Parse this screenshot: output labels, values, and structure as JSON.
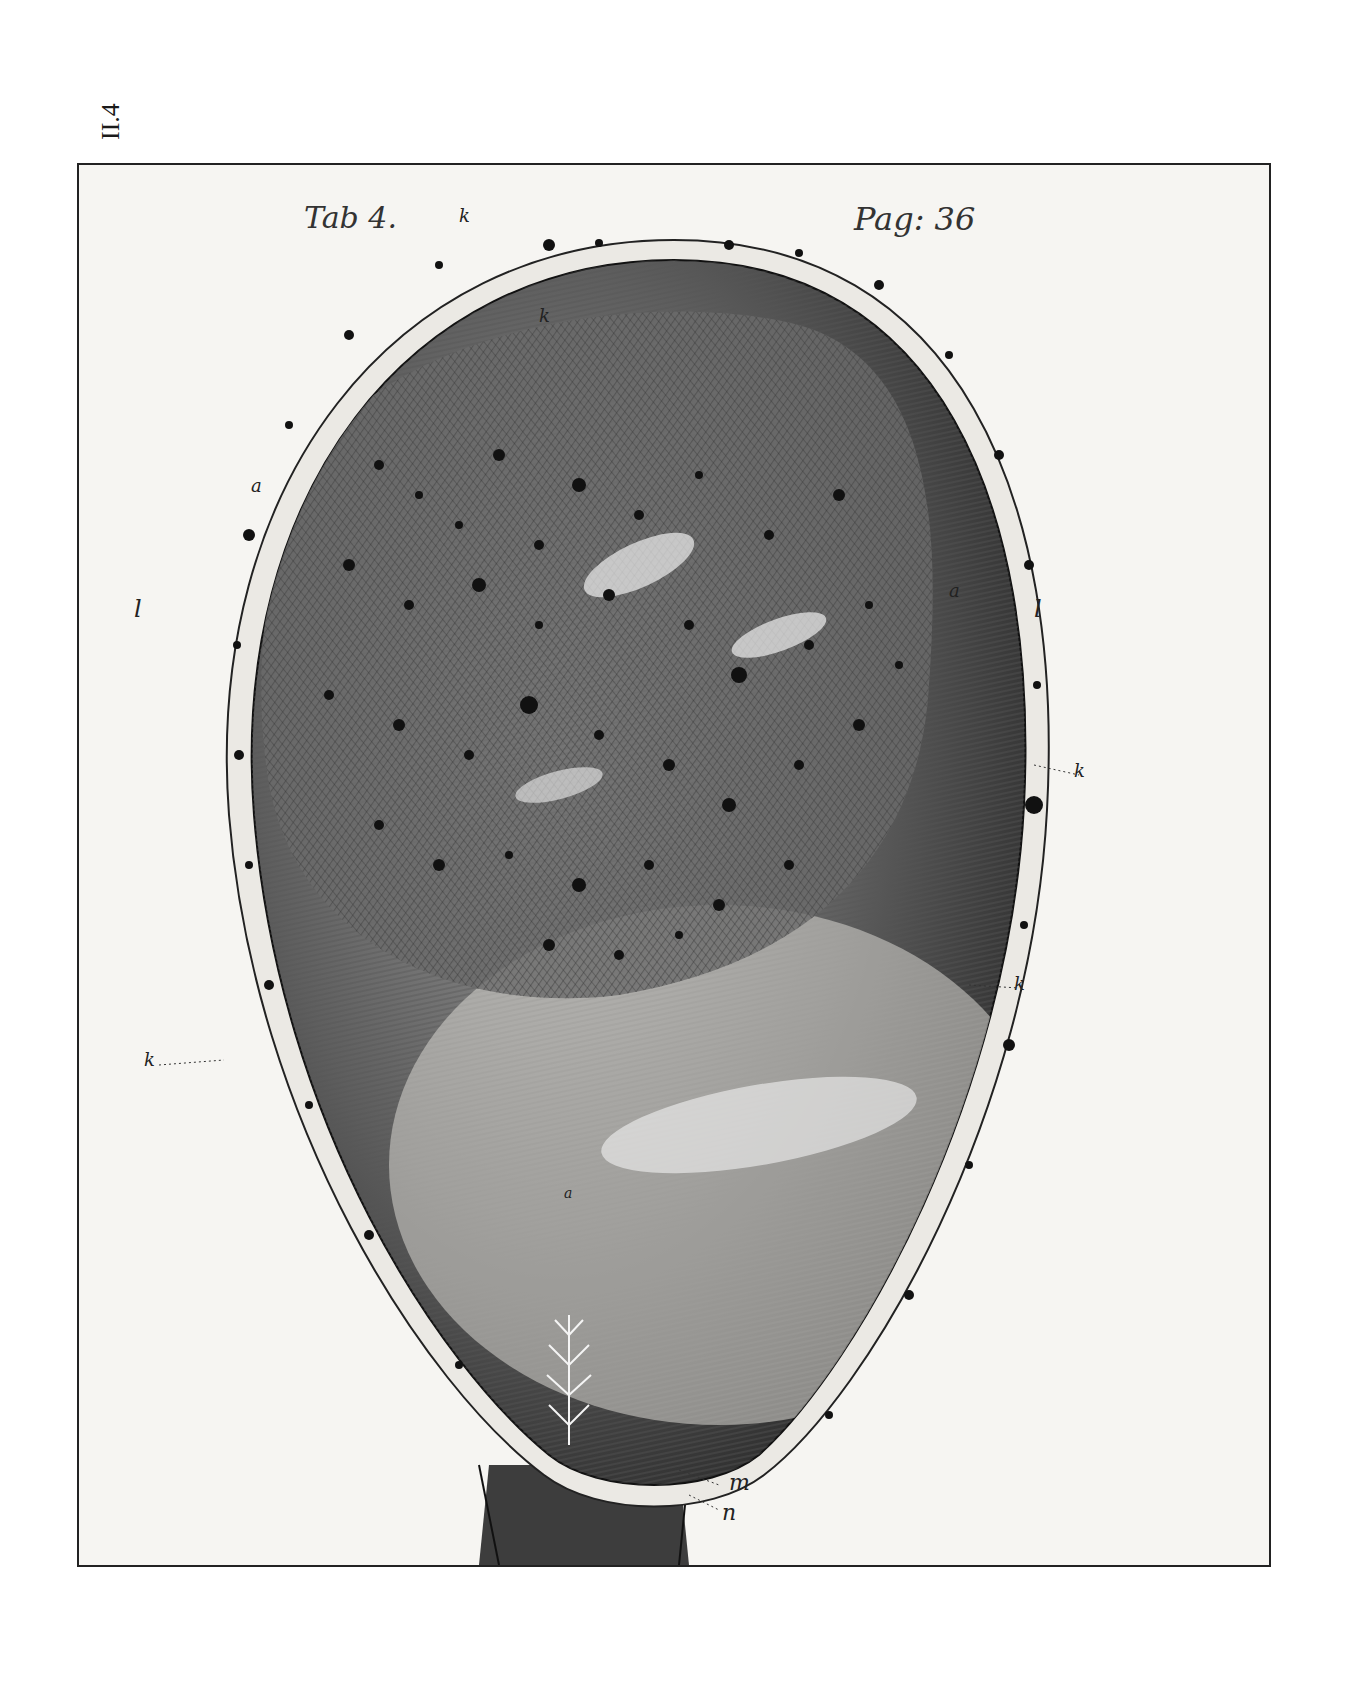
{
  "side_label": "II.4",
  "plate": {
    "tab_label": "Tab 4.",
    "page_label": "Pag: 36",
    "markers": [
      {
        "id": "k-top",
        "text": "k"
      },
      {
        "id": "k-inner",
        "text": "k"
      },
      {
        "id": "l-left",
        "text": "l"
      },
      {
        "id": "l-right",
        "text": "l"
      },
      {
        "id": "a-left",
        "text": "a"
      },
      {
        "id": "a-right",
        "text": "a"
      },
      {
        "id": "k-right-upper",
        "text": "k"
      },
      {
        "id": "k-right-lower",
        "text": "k"
      },
      {
        "id": "k-left-lower",
        "text": "k"
      },
      {
        "id": "a-center",
        "text": "a"
      },
      {
        "id": "m-bottom",
        "text": "m"
      },
      {
        "id": "n-bottom",
        "text": "n"
      }
    ]
  }
}
